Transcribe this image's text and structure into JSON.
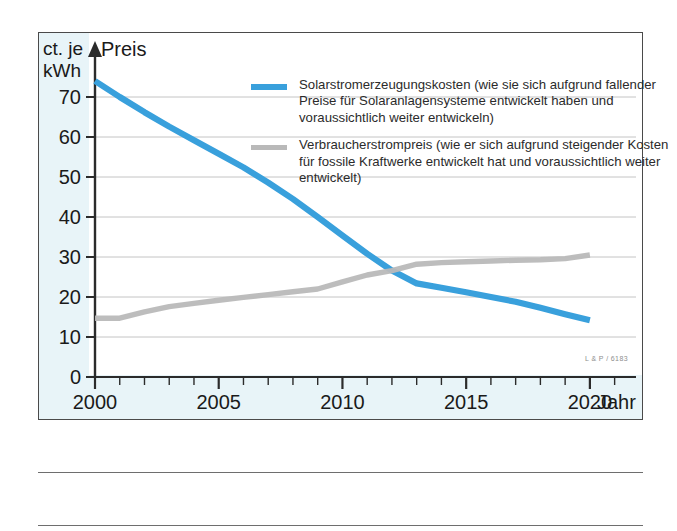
{
  "chart_data": {
    "type": "line",
    "title": "",
    "xlabel": "Jahr",
    "ylabel": "ct. je kWh",
    "ylabel_line1": "ct. je",
    "ylabel_line2": "kWh",
    "yaxis_arrow_label": "Preis",
    "xlim": [
      2000,
      2021.5
    ],
    "ylim": [
      0,
      76
    ],
    "grid": "horizontal",
    "legend_position": "top-right-inside",
    "y_ticks": [
      0,
      10,
      20,
      30,
      40,
      50,
      60,
      70
    ],
    "y_tick_labels": [
      "0",
      "10",
      "20",
      "30",
      "40",
      "50",
      "60",
      "70"
    ],
    "x_ticks": [
      2000,
      2001,
      2002,
      2003,
      2004,
      2005,
      2006,
      2007,
      2008,
      2009,
      2010,
      2011,
      2012,
      2013,
      2014,
      2015,
      2016,
      2017,
      2018,
      2019,
      2020,
      2021
    ],
    "x_tick_labels": [
      "2000",
      "2005",
      "2010",
      "2015",
      "2020"
    ],
    "x_major_ticks": [
      2000,
      2005,
      2010,
      2015,
      2020
    ],
    "series": [
      {
        "name": "Solarstromerzeugungskosten",
        "color": "#39a0dc",
        "x": [
          2000,
          2001,
          2002,
          2003,
          2004,
          2005,
          2006,
          2007,
          2008,
          2009,
          2010,
          2011,
          2012,
          2013,
          2014,
          2015,
          2016,
          2017,
          2018,
          2019,
          2020
        ],
        "values": [
          74.0,
          70.0,
          66.2,
          62.6,
          59.2,
          55.8,
          52.4,
          48.6,
          44.5,
          40.0,
          35.4,
          30.8,
          26.6,
          23.4,
          22.3,
          21.2,
          20.0,
          18.8,
          17.3,
          15.7,
          14.2
        ]
      },
      {
        "name": "Verbraucherstrompreis",
        "color": "#b9b9b9",
        "x": [
          2000,
          2001,
          2002,
          2003,
          2004,
          2005,
          2006,
          2007,
          2008,
          2009,
          2010,
          2011,
          2012,
          2013,
          2014,
          2015,
          2016,
          2017,
          2018,
          2019,
          2020
        ],
        "values": [
          14.7,
          14.7,
          16.3,
          17.6,
          18.4,
          19.2,
          19.9,
          20.6,
          21.3,
          22.0,
          23.8,
          25.5,
          26.6,
          28.2,
          28.6,
          28.8,
          29.0,
          29.2,
          29.3,
          29.6,
          30.5
        ]
      }
    ],
    "crossover": {
      "year": 2012,
      "value": 26.6
    }
  },
  "legend": [
    {
      "swatch_color": "#39a0dc",
      "swatch_style": "blue",
      "text": "Solarstromerzeugungskosten (wie sie sich aufgrund fallender Preise für Solaranlagensysteme entwickelt haben und voraussichtlich weiter entwickeln)"
    },
    {
      "swatch_color": "#b9b9b9",
      "swatch_style": "gray",
      "text": "Verbraucherstrompreis (wie er sich aufgrund steigender Kosten für fossile Kraftwerke entwickelt hat und voraussichtlich weiter entwickelt)"
    }
  ],
  "credit": "L & P / 6183"
}
